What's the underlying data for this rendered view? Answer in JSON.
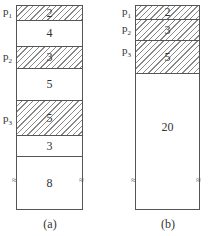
{
  "figure_a": {
    "caption": "(a)",
    "blocks": [
      {
        "label": "2",
        "allocated": true,
        "pointer": "p",
        "pointer_sub": "1"
      },
      {
        "label": "4",
        "allocated": false
      },
      {
        "label": "3",
        "allocated": true,
        "pointer": "p",
        "pointer_sub": "2"
      },
      {
        "label": "5",
        "allocated": false
      },
      {
        "label": "5",
        "allocated": true,
        "pointer": "p",
        "pointer_sub": "3"
      },
      {
        "label": "3",
        "allocated": false
      },
      {
        "label": "8",
        "allocated": false,
        "break_marks": true
      }
    ],
    "break_symbol": "≈"
  },
  "figure_b": {
    "caption": "(b)",
    "blocks": [
      {
        "label": "2",
        "allocated": true,
        "pointer": "p",
        "pointer_sub": "1"
      },
      {
        "label": "3",
        "allocated": true,
        "pointer": "p",
        "pointer_sub": "2"
      },
      {
        "label": "5",
        "allocated": true,
        "pointer": "p",
        "pointer_sub": "3"
      },
      {
        "label": "20",
        "allocated": false,
        "break_marks": true
      }
    ],
    "break_symbol": "≈"
  }
}
